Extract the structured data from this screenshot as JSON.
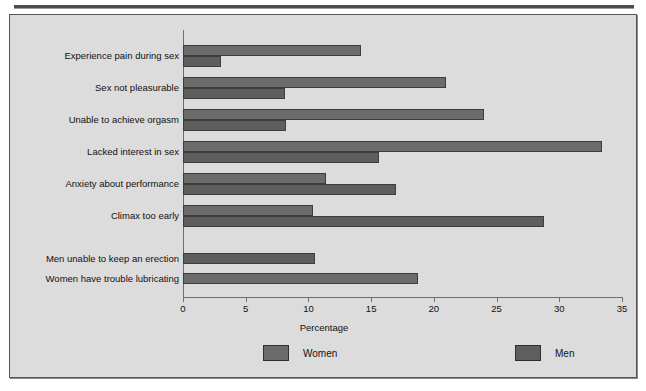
{
  "chart_data": {
    "type": "bar",
    "orientation": "horizontal",
    "title": "",
    "xlabel": "Percentage",
    "ylabel": "",
    "xlim": [
      0,
      35
    ],
    "xticks": [
      0,
      5,
      10,
      15,
      20,
      25,
      30,
      35
    ],
    "grid": false,
    "legend_position": "bottom",
    "categories": [
      "Experience pain during sex",
      "Sex not pleasurable",
      "Unable to achieve orgasm",
      "Lacked interest in sex",
      "Anxiety about performance",
      "Climax too early",
      "Men unable to keep an erection",
      "Women have trouble lubricating"
    ],
    "series": [
      {
        "name": "Women",
        "color": "#6b6b6b",
        "values": [
          14.2,
          21.0,
          24.0,
          33.4,
          11.4,
          10.4,
          null,
          18.7
        ]
      },
      {
        "name": "Men",
        "color": "#5e5e5e",
        "values": [
          3.0,
          8.1,
          8.2,
          15.6,
          17.0,
          28.8,
          10.5,
          null
        ]
      }
    ]
  },
  "legend": {
    "items": [
      {
        "label": "Women",
        "color": "#6b6b6b"
      },
      {
        "label": "Men",
        "color": "#5e5e5e"
      }
    ]
  },
  "axis": {
    "x_title": "Percentage",
    "tick_labels": [
      "0",
      "5",
      "10",
      "15",
      "20",
      "25",
      "30",
      "35"
    ]
  },
  "colors": {
    "panel_background": "#dcdcdc",
    "panel_border": "#555555",
    "axis": "#6e6e6e",
    "women_bar": "#6b6b6b",
    "men_bar": "#5e5e5e",
    "text": "#111111"
  }
}
